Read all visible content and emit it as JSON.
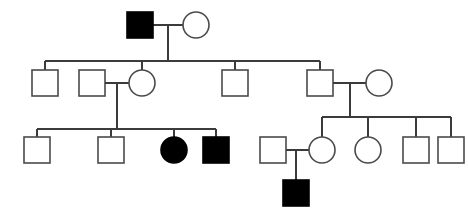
{
  "chart_data": {
    "type": "diagram",
    "diagram_kind": "pedigree",
    "canvas": {
      "width": 468,
      "height": 220,
      "background": "#ffffff"
    },
    "symbol_key": {
      "square": "male",
      "circle": "female",
      "filled": "affected",
      "open": "unaffected"
    },
    "colors": {
      "affected_fill": "#000000",
      "unaffected_fill": "#ffffff",
      "symbol_stroke": "#4a4a4a",
      "line_stroke": "#3b3b3b"
    },
    "symbol_size": 26,
    "generation_count": 4,
    "counts": {
      "total_individuals": 21,
      "affected_total": 4,
      "affected_males": 3,
      "affected_females": 1,
      "males": 13,
      "females": 8
    },
    "individuals": [
      {
        "id": "I-1",
        "generation": 1,
        "sex": "male",
        "status": "affected",
        "shape": "square",
        "cx": 140,
        "cy": 25
      },
      {
        "id": "I-2",
        "generation": 1,
        "sex": "female",
        "status": "unaffected",
        "shape": "circle",
        "cx": 196,
        "cy": 25
      },
      {
        "id": "II-1",
        "generation": 2,
        "sex": "male",
        "status": "unaffected",
        "shape": "square",
        "cx": 45,
        "cy": 83
      },
      {
        "id": "II-2",
        "generation": 2,
        "sex": "male",
        "status": "unaffected",
        "shape": "square",
        "cx": 92,
        "cy": 83,
        "married_in": true
      },
      {
        "id": "II-3",
        "generation": 2,
        "sex": "female",
        "status": "unaffected",
        "shape": "circle",
        "cx": 142,
        "cy": 83
      },
      {
        "id": "II-4",
        "generation": 2,
        "sex": "male",
        "status": "unaffected",
        "shape": "square",
        "cx": 235,
        "cy": 83
      },
      {
        "id": "II-5",
        "generation": 2,
        "sex": "male",
        "status": "unaffected",
        "shape": "square",
        "cx": 320,
        "cy": 83
      },
      {
        "id": "II-6",
        "generation": 2,
        "sex": "female",
        "status": "unaffected",
        "shape": "circle",
        "cx": 379,
        "cy": 83,
        "married_in": true
      },
      {
        "id": "III-1",
        "generation": 3,
        "sex": "male",
        "status": "unaffected",
        "shape": "square",
        "cx": 37,
        "cy": 150
      },
      {
        "id": "III-2",
        "generation": 3,
        "sex": "male",
        "status": "unaffected",
        "shape": "square",
        "cx": 111,
        "cy": 150
      },
      {
        "id": "III-3",
        "generation": 3,
        "sex": "female",
        "status": "affected",
        "shape": "circle",
        "cx": 174,
        "cy": 150
      },
      {
        "id": "III-4",
        "generation": 3,
        "sex": "male",
        "status": "affected",
        "shape": "square",
        "cx": 216,
        "cy": 150
      },
      {
        "id": "III-5",
        "generation": 3,
        "sex": "male",
        "status": "unaffected",
        "shape": "square",
        "cx": 273,
        "cy": 150,
        "married_in": true
      },
      {
        "id": "III-6",
        "generation": 3,
        "sex": "female",
        "status": "unaffected",
        "shape": "circle",
        "cx": 322,
        "cy": 150
      },
      {
        "id": "III-7",
        "generation": 3,
        "sex": "female",
        "status": "unaffected",
        "shape": "circle",
        "cx": 368,
        "cy": 150
      },
      {
        "id": "III-8",
        "generation": 3,
        "sex": "male",
        "status": "unaffected",
        "shape": "square",
        "cx": 416,
        "cy": 150
      },
      {
        "id": "III-9",
        "generation": 3,
        "sex": "male",
        "status": "unaffected",
        "shape": "square",
        "cx": 451,
        "cy": 150
      },
      {
        "id": "IV-1",
        "generation": 4,
        "sex": "male",
        "status": "affected",
        "shape": "square",
        "cx": 296,
        "cy": 193
      }
    ],
    "matings": [
      {
        "id": "M1",
        "partners": [
          "I-1",
          "I-2"
        ],
        "line_y": 25,
        "x_from": 153,
        "x_to": 183,
        "descent_x": 168,
        "children": [
          "II-1",
          "II-2-spouse",
          "II-3",
          "II-4",
          "II-5"
        ]
      },
      {
        "id": "M2",
        "partners": [
          "II-2",
          "II-3"
        ],
        "line_y": 83,
        "x_from": 105,
        "x_to": 129,
        "descent_x": 117,
        "children": [
          "III-1",
          "III-2",
          "III-3",
          "III-4"
        ]
      },
      {
        "id": "M3",
        "partners": [
          "II-5",
          "II-6"
        ],
        "line_y": 83,
        "x_from": 333,
        "x_to": 366,
        "descent_x": 350,
        "children": [
          "III-6",
          "III-7",
          "III-8",
          "III-9"
        ]
      },
      {
        "id": "M4",
        "partners": [
          "III-5",
          "III-6"
        ],
        "line_y": 150,
        "x_from": 286,
        "x_to": 309,
        "descent_x": 296,
        "children": [
          "IV-1"
        ]
      }
    ],
    "sibships": [
      {
        "id": "S1",
        "parents": "M1",
        "bar_y": 61,
        "x_from": 45,
        "x_to": 320,
        "drop_xs": [
          45,
          142,
          235,
          320
        ],
        "member_ids": [
          "II-1",
          "II-3",
          "II-4",
          "II-5"
        ]
      },
      {
        "id": "S2",
        "parents": "M2",
        "bar_y": 129,
        "x_from": 37,
        "x_to": 216,
        "drop_xs": [
          37,
          111,
          174,
          216
        ],
        "member_ids": [
          "III-1",
          "III-2",
          "III-3",
          "III-4"
        ]
      },
      {
        "id": "S3",
        "parents": "M3",
        "bar_y": 117,
        "x_from": 322,
        "x_to": 451,
        "drop_xs": [
          322,
          368,
          416,
          451
        ],
        "member_ids": [
          "III-6",
          "III-7",
          "III-8",
          "III-9"
        ]
      }
    ]
  }
}
